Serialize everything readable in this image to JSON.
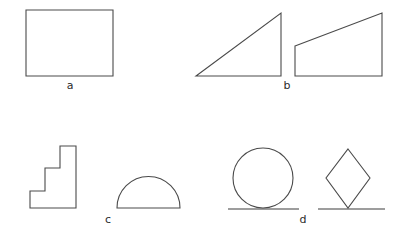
{
  "figure": {
    "background_color": "#ffffff",
    "stroke_color": "#4a4a4a",
    "baseline_color": "#3c3c3c",
    "label_color": "#2b2b2b",
    "width": 405,
    "height": 242
  },
  "groups": [
    {
      "id": "a",
      "label": "a",
      "label_x": 70,
      "label_y": 85,
      "shapes": [
        {
          "name": "rectangle",
          "type": "polygon",
          "points": "26,10 113,10 113,76 26,76",
          "closed": true
        }
      ]
    },
    {
      "id": "b",
      "label": "b",
      "label_x": 287,
      "label_y": 85,
      "shapes": [
        {
          "name": "right-triangle",
          "type": "polygon",
          "points": "196,76 281,76 281,13",
          "closed": true
        },
        {
          "name": "right-trapezoid",
          "type": "polygon",
          "points": "295,46 382,13 382,76 295,76",
          "closed": true
        }
      ]
    },
    {
      "id": "c",
      "label": "c",
      "label_x": 108,
      "label_y": 219,
      "shapes": [
        {
          "name": "staircase-polygon",
          "type": "polygon",
          "points": "30,191 30,208 76,208 76,146 60,146 60,168 45,168 45,191",
          "closed": true
        },
        {
          "name": "semicircle-dome",
          "type": "path",
          "d": "M 117 208 A 31.5 31.5 0 0 1 180 208 Z"
        }
      ]
    },
    {
      "id": "d",
      "label": "d",
      "label_x": 303,
      "label_y": 219,
      "shapes": [
        {
          "name": "circle-on-tangent-line",
          "type": "circle",
          "cx": 263,
          "cy": 178,
          "r": 30
        },
        {
          "name": "circle-tangent-baseline",
          "type": "line",
          "x1": 228,
          "y1": 209,
          "x2": 299,
          "y2": 209
        },
        {
          "name": "diamond-on-vertex",
          "type": "polygon",
          "points": "348,149 370,178 348,208 326,178",
          "closed": true
        },
        {
          "name": "diamond-baseline",
          "type": "line",
          "x1": 318,
          "y1": 209,
          "x2": 385,
          "y2": 209
        }
      ]
    }
  ]
}
